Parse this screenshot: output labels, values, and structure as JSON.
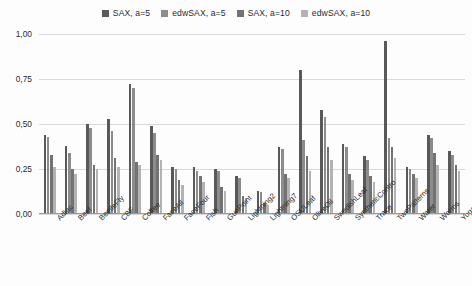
{
  "chart_data": {
    "type": "bar",
    "title": "",
    "subtitle": "",
    "xlabel": "",
    "ylabel": "",
    "ylim": [
      0,
      1.0
    ],
    "ytick_labels": [
      "1,00",
      "0,75",
      "0,50",
      "0,25",
      "0,00"
    ],
    "ytick_values": [
      1.0,
      0.75,
      0.5,
      0.25,
      0.0
    ],
    "grid": true,
    "legend_position": "top-center",
    "decimal_separator": ",",
    "categories": [
      "Adiac",
      "Beef",
      "BeetleFly",
      "CBF",
      "Coffee",
      "FaceAll",
      "FaceFour",
      "Fish",
      "GunPoint",
      "Lightning2",
      "Lightning7",
      "OSULeaf",
      "OliveOil",
      "SwedishLeaf",
      "SyntheticContro",
      "Trace",
      "TwoPatterns",
      "Water",
      "Worms",
      "Yoga"
    ],
    "series": [
      {
        "name": "SAX, a=5",
        "color": "#595959",
        "values": [
          0.44,
          0.38,
          0.5,
          0.53,
          0.72,
          0.49,
          0.26,
          0.26,
          0.25,
          0.21,
          0.13,
          0.37,
          0.8,
          0.58,
          0.39,
          0.32,
          0.96,
          0.26,
          0.44,
          0.35
        ]
      },
      {
        "name": "edwSAX, a=5",
        "color": "#8c8c8c",
        "values": [
          0.43,
          0.34,
          0.48,
          0.46,
          0.7,
          0.45,
          0.25,
          0.24,
          0.24,
          0.2,
          0.12,
          0.36,
          0.41,
          0.54,
          0.37,
          0.3,
          0.42,
          0.25,
          0.42,
          0.33
        ]
      },
      {
        "name": "SAX, a=10",
        "color": "#737373",
        "values": [
          0.33,
          0.25,
          0.27,
          0.31,
          0.29,
          0.33,
          0.19,
          0.21,
          0.15,
          0.1,
          0.06,
          0.22,
          0.32,
          0.37,
          0.22,
          0.21,
          0.37,
          0.22,
          0.34,
          0.27
        ]
      },
      {
        "name": "edwSAX, a=10",
        "color": "#b3b3b3",
        "values": [
          0.26,
          0.22,
          0.25,
          0.26,
          0.27,
          0.3,
          0.16,
          0.18,
          0.13,
          0.09,
          0.05,
          0.2,
          0.24,
          0.3,
          0.19,
          0.18,
          0.31,
          0.2,
          0.27,
          0.24
        ]
      }
    ]
  }
}
